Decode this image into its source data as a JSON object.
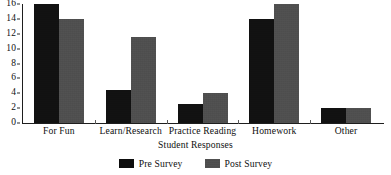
{
  "chart_data": {
    "type": "bar",
    "title": "",
    "xlabel": "Student Responses",
    "ylabel": "",
    "categories": [
      "For Fun",
      "Learn/Research",
      "Practice Reading",
      "Homework",
      "Other"
    ],
    "series": [
      {
        "name": "Pre Survey",
        "color": "#0d0d0d",
        "values": [
          16,
          4.5,
          2.5,
          14,
          2
        ]
      },
      {
        "name": "Post Survey",
        "color": "#4b4b4b",
        "values": [
          14,
          11.5,
          4,
          16,
          2
        ]
      }
    ],
    "ylim": [
      0,
      16
    ],
    "yticks": [
      0,
      2,
      4,
      6,
      8,
      10,
      12,
      14,
      16
    ],
    "ytick_labels": [
      "0",
      "2",
      "4",
      "6",
      "8",
      "10",
      "12",
      "14",
      "16"
    ],
    "grid": false,
    "legend_position": "bottom"
  },
  "legend": {
    "entries": [
      {
        "label": "Pre Survey"
      },
      {
        "label": "Post Survey"
      }
    ]
  }
}
